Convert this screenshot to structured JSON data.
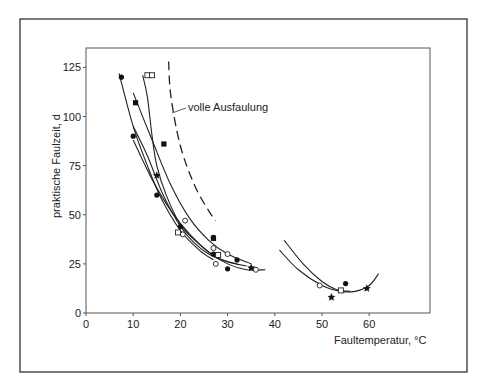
{
  "chart_data": {
    "type": "scatter",
    "title": "",
    "xlabel": "Faultemperatur, °C",
    "ylabel": "praktische Faulzeit, d",
    "xlim": [
      0,
      70
    ],
    "ylim": [
      0,
      135
    ],
    "x_ticks": [
      "0",
      "10",
      "20",
      "30",
      "40",
      "50",
      "60"
    ],
    "y_ticks": [
      "0",
      "25",
      "50",
      "75",
      "100",
      "125"
    ],
    "grid": false,
    "legend": null,
    "annotations": [
      {
        "text": "volle Ausfaulung",
        "x": 17,
        "y": 100,
        "points_to": "dashed curve"
      }
    ],
    "series": [
      {
        "name": "filled circles",
        "marker": "circle-filled",
        "points": [
          [
            7.5,
            120
          ],
          [
            10,
            90
          ],
          [
            15,
            60
          ],
          [
            20,
            44
          ],
          [
            27,
            30
          ],
          [
            27,
            38.5
          ],
          [
            30,
            22.5
          ],
          [
            32,
            27
          ],
          [
            55,
            15
          ]
        ]
      },
      {
        "name": "filled squares",
        "marker": "square-filled",
        "points": [
          [
            10.5,
            107
          ],
          [
            16.5,
            86
          ],
          [
            27,
            38
          ]
        ]
      },
      {
        "name": "open circles",
        "marker": "circle-open",
        "points": [
          [
            21,
            47
          ],
          [
            20.5,
            40
          ],
          [
            27,
            33
          ],
          [
            27.5,
            25
          ],
          [
            30,
            30
          ],
          [
            36,
            22
          ],
          [
            49.5,
            14
          ]
        ]
      },
      {
        "name": "open squares",
        "marker": "square-open",
        "points": [
          [
            13,
            121
          ],
          [
            14,
            121
          ],
          [
            19.5,
            41
          ],
          [
            28,
            29.5
          ],
          [
            54,
            11.5
          ]
        ]
      },
      {
        "name": "stars",
        "marker": "star",
        "points": [
          [
            15,
            70
          ],
          [
            35,
            23
          ],
          [
            52,
            8
          ],
          [
            59.5,
            12.5
          ]
        ]
      }
    ],
    "curves": [
      {
        "name": "volle Ausfaulung",
        "style": "dashed",
        "points": [
          [
            17.5,
            128
          ],
          [
            18,
            110
          ],
          [
            20,
            85
          ],
          [
            23,
            65
          ],
          [
            26,
            52
          ],
          [
            27.5,
            47
          ]
        ]
      },
      {
        "name": "curve A",
        "style": "solid",
        "points": [
          [
            7,
            122
          ],
          [
            10,
            95
          ],
          [
            13,
            75
          ],
          [
            16,
            58
          ],
          [
            20,
            42
          ],
          [
            24,
            32
          ],
          [
            27,
            27
          ]
        ]
      },
      {
        "name": "curve B",
        "style": "solid",
        "points": [
          [
            10,
            112
          ],
          [
            14,
            88
          ],
          [
            18,
            65
          ],
          [
            22,
            48
          ],
          [
            26,
            37
          ],
          [
            30,
            30
          ],
          [
            35,
            25
          ]
        ]
      },
      {
        "name": "curve C",
        "style": "solid",
        "points": [
          [
            10,
            88
          ],
          [
            14,
            68
          ],
          [
            18,
            52
          ],
          [
            22,
            40
          ],
          [
            26,
            31
          ],
          [
            30,
            25
          ],
          [
            34,
            22
          ],
          [
            38,
            22
          ]
        ]
      },
      {
        "name": "curve D",
        "style": "solid",
        "points": [
          [
            12,
            121
          ],
          [
            13,
            110
          ],
          [
            14,
            90
          ],
          [
            15,
            75
          ],
          [
            17,
            60
          ],
          [
            20,
            45
          ],
          [
            24,
            35
          ],
          [
            28,
            28
          ],
          [
            32,
            25
          ]
        ]
      },
      {
        "name": "curve E",
        "style": "solid",
        "points": [
          [
            10,
            95
          ],
          [
            13,
            80
          ],
          [
            16,
            62
          ],
          [
            19,
            48
          ],
          [
            22,
            38
          ],
          [
            26,
            30
          ],
          [
            30,
            26
          ],
          [
            34,
            24
          ]
        ]
      },
      {
        "name": "thermophilic A",
        "style": "solid",
        "points": [
          [
            41,
            32
          ],
          [
            45,
            22
          ],
          [
            50,
            14
          ],
          [
            54,
            11
          ],
          [
            57,
            11
          ],
          [
            60,
            14
          ],
          [
            62,
            20
          ]
        ]
      },
      {
        "name": "thermophilic B",
        "style": "solid",
        "points": [
          [
            42,
            37
          ],
          [
            46,
            25
          ],
          [
            50,
            16
          ],
          [
            53,
            12
          ],
          [
            56,
            11
          ]
        ]
      }
    ]
  },
  "axes": {
    "x_label": "Faultemperatur,",
    "x_unit": "°C",
    "y_label": "praktische Faulzeit, d"
  },
  "annotation": {
    "text": "volle Ausfaulung"
  }
}
